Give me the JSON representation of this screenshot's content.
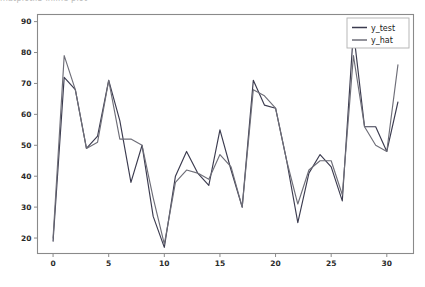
{
  "figure": {
    "clipped_top_text": "matplotlib inline   plot",
    "background": "#ffffff"
  },
  "legend": {
    "position": "upper-right",
    "entries": [
      {
        "label": "y_test",
        "color": "#3b3b4f"
      },
      {
        "label": "y_hat",
        "color": "#6e6e78"
      }
    ]
  },
  "axes": {
    "x_ticks": [
      "0",
      "5",
      "10",
      "15",
      "20",
      "25",
      "30"
    ],
    "y_ticks": [
      "20",
      "30",
      "40",
      "50",
      "60",
      "70",
      "80",
      "90"
    ],
    "xlim": [
      -1.4,
      32.4
    ],
    "ylim": [
      15.0,
      92.3
    ],
    "spine_color": "#8a8a8a",
    "tick_color": "#2a2a2a"
  },
  "chart_data": {
    "type": "line",
    "title": "",
    "xlabel": "",
    "ylabel": "",
    "xlim": [
      -1.4,
      32.4
    ],
    "ylim": [
      15.0,
      92.3
    ],
    "grid": false,
    "legend_position": "upper right",
    "x": [
      0,
      1,
      2,
      3,
      4,
      5,
      6,
      7,
      8,
      9,
      10,
      11,
      12,
      13,
      14,
      15,
      16,
      17,
      18,
      19,
      20,
      21,
      22,
      23,
      24,
      25,
      26,
      27,
      28,
      29,
      30,
      31
    ],
    "series": [
      {
        "name": "y_test",
        "color": "#3b3b4f",
        "values": [
          19,
          72,
          68,
          49,
          53,
          71,
          58,
          38,
          50,
          27,
          17,
          40,
          48,
          41,
          37,
          55,
          42,
          30,
          71,
          63,
          62,
          45,
          25,
          41,
          47,
          43,
          32,
          87,
          56,
          56,
          48,
          64
        ]
      },
      {
        "name": "y_hat",
        "color": "#6e6e78",
        "values": [
          20,
          79,
          68,
          49,
          51,
          71,
          52,
          52,
          50,
          33,
          18,
          38,
          42,
          41,
          39,
          47,
          43,
          30,
          68,
          66,
          62,
          45,
          31,
          42,
          45,
          45,
          34,
          79,
          56,
          50,
          48,
          76
        ]
      }
    ]
  }
}
